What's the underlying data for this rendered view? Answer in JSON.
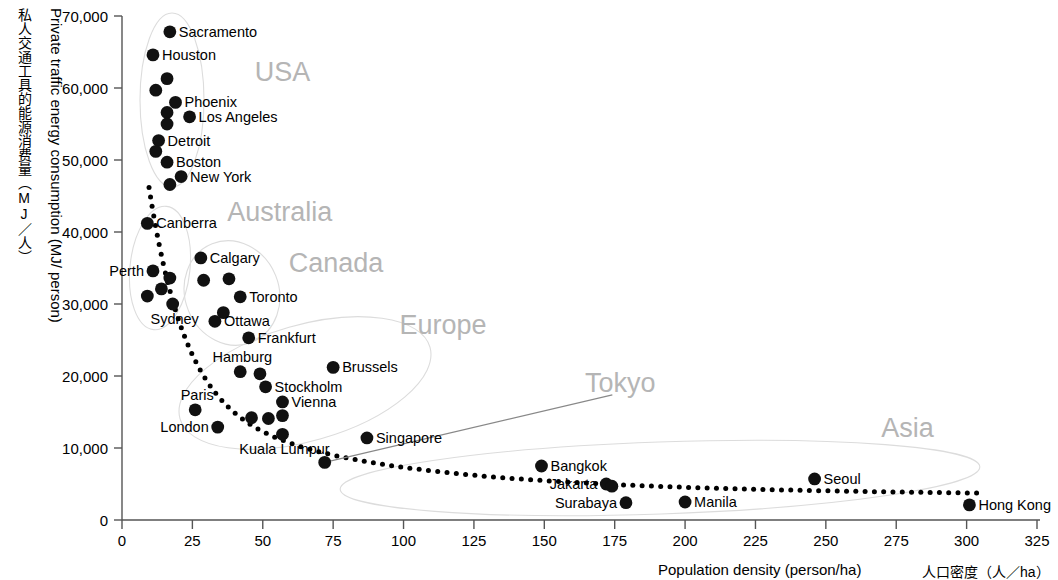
{
  "chart_data": {
    "type": "scatter",
    "title": "",
    "xlabel": "Population density (person/ha)",
    "xlabel_jp": "人口密度（人／ha）",
    "ylabel": "Private traffic energy consumption (MJ/ person)",
    "ylabel_jp": "私人交通工具的能源消费量（MJ／人）",
    "xlim": [
      0,
      325
    ],
    "ylim": [
      0,
      70000
    ],
    "xticks": [
      0,
      25,
      50,
      75,
      100,
      125,
      150,
      175,
      200,
      225,
      250,
      275,
      300,
      325
    ],
    "xtick_labels": [
      "0",
      "25",
      "50",
      "75",
      "100",
      "125",
      "150",
      "175",
      "200",
      "225",
      "250",
      "275",
      "300",
      "325"
    ],
    "yticks": [
      0,
      10000,
      20000,
      30000,
      40000,
      50000,
      60000,
      70000
    ],
    "ytick_labels": [
      "0",
      "10,000",
      "20,000",
      "30,000",
      "40,000",
      "50,000",
      "60,000",
      "70,000"
    ],
    "grid": false,
    "legend": "none",
    "point_color": "#111111",
    "trend_color": "#000000",
    "region_label_color": "#b5b5b5",
    "points": [
      {
        "name": "Sacramento",
        "x": 17,
        "y": 67800,
        "label_pos": "right"
      },
      {
        "name": "Houston",
        "x": 11,
        "y": 64600,
        "label_pos": "right"
      },
      {
        "name": "",
        "x": 16,
        "y": 61300,
        "label_pos": "none"
      },
      {
        "name": "",
        "x": 12,
        "y": 59700,
        "label_pos": "none"
      },
      {
        "name": "Phoenix",
        "x": 19,
        "y": 58000,
        "label_pos": "right"
      },
      {
        "name": "",
        "x": 16,
        "y": 56600,
        "label_pos": "none"
      },
      {
        "name": "Los Angeles",
        "x": 24,
        "y": 56000,
        "label_pos": "right"
      },
      {
        "name": "",
        "x": 16,
        "y": 55000,
        "label_pos": "none"
      },
      {
        "name": "Detroit",
        "x": 13,
        "y": 52700,
        "label_pos": "right"
      },
      {
        "name": "",
        "x": 12,
        "y": 51200,
        "label_pos": "none"
      },
      {
        "name": "Boston",
        "x": 16,
        "y": 49700,
        "label_pos": "right"
      },
      {
        "name": "New York",
        "x": 21,
        "y": 47700,
        "label_pos": "right"
      },
      {
        "name": "",
        "x": 17,
        "y": 46600,
        "label_pos": "none"
      },
      {
        "name": "Canberra",
        "x": 9,
        "y": 41200,
        "label_pos": "right"
      },
      {
        "name": "Calgary",
        "x": 28,
        "y": 36400,
        "label_pos": "right"
      },
      {
        "name": "Perth",
        "x": 11,
        "y": 34600,
        "label_pos": "left"
      },
      {
        "name": "",
        "x": 17,
        "y": 33600,
        "label_pos": "none"
      },
      {
        "name": "",
        "x": 29,
        "y": 33300,
        "label_pos": "none"
      },
      {
        "name": "",
        "x": 38,
        "y": 33500,
        "label_pos": "none"
      },
      {
        "name": "",
        "x": 14,
        "y": 32100,
        "label_pos": "none"
      },
      {
        "name": "",
        "x": 9,
        "y": 31100,
        "label_pos": "none"
      },
      {
        "name": "Toronto",
        "x": 42,
        "y": 31000,
        "label_pos": "right"
      },
      {
        "name": "Sydney",
        "x": 18,
        "y": 30000,
        "label_pos": "below"
      },
      {
        "name": "",
        "x": 36,
        "y": 28800,
        "label_pos": "none"
      },
      {
        "name": "Ottawa",
        "x": 33,
        "y": 27600,
        "label_pos": "right"
      },
      {
        "name": "Frankfurt",
        "x": 45,
        "y": 25300,
        "label_pos": "right"
      },
      {
        "name": "Hamburg",
        "x": 42,
        "y": 20600,
        "label_pos": "above"
      },
      {
        "name": "",
        "x": 49,
        "y": 20300,
        "label_pos": "none"
      },
      {
        "name": "Brussels",
        "x": 75,
        "y": 21200,
        "label_pos": "right"
      },
      {
        "name": "Stockholm",
        "x": 51,
        "y": 18500,
        "label_pos": "right"
      },
      {
        "name": "Vienna",
        "x": 57,
        "y": 16400,
        "label_pos": "right"
      },
      {
        "name": "Paris",
        "x": 26,
        "y": 15300,
        "label_pos": "above"
      },
      {
        "name": "",
        "x": 46,
        "y": 14200,
        "label_pos": "none"
      },
      {
        "name": "",
        "x": 52,
        "y": 14100,
        "label_pos": "none"
      },
      {
        "name": "",
        "x": 57,
        "y": 14500,
        "label_pos": "none"
      },
      {
        "name": "London",
        "x": 34,
        "y": 12900,
        "label_pos": "left"
      },
      {
        "name": "Kuala Lumpur",
        "x": 57,
        "y": 11900,
        "label_pos": "below"
      },
      {
        "name": "Singapore",
        "x": 87,
        "y": 11400,
        "label_pos": "right"
      },
      {
        "name": "Tokyo",
        "x": 72,
        "y": 8000,
        "label_pos": "leader"
      },
      {
        "name": "Bangkok",
        "x": 149,
        "y": 7500,
        "label_pos": "right"
      },
      {
        "name": "Jakarta",
        "x": 172,
        "y": 5000,
        "label_pos": "left"
      },
      {
        "name": "",
        "x": 174,
        "y": 4700,
        "label_pos": "none"
      },
      {
        "name": "Surabaya",
        "x": 179,
        "y": 2400,
        "label_pos": "left"
      },
      {
        "name": "Manila",
        "x": 200,
        "y": 2500,
        "label_pos": "right"
      },
      {
        "name": "Seoul",
        "x": 246,
        "y": 5700,
        "label_pos": "right"
      },
      {
        "name": "Hong Kong",
        "x": 301,
        "y": 2100,
        "label_pos": "right"
      }
    ],
    "region_labels": [
      {
        "name": "USA",
        "x": 57,
        "y": 61000
      },
      {
        "name": "Australia",
        "x": 56,
        "y": 41500
      },
      {
        "name": "Canada",
        "x": 76,
        "y": 34500
      },
      {
        "name": "Europe",
        "x": 114,
        "y": 25800
      },
      {
        "name": "Tokyo",
        "x": 177,
        "y": 17800
      },
      {
        "name": "Asia",
        "x": 279,
        "y": 11500
      }
    ],
    "trend_line": {
      "style": "dotted",
      "description": "Dotted exponential decay curve from high energy use at low density to low energy use at high density"
    }
  }
}
